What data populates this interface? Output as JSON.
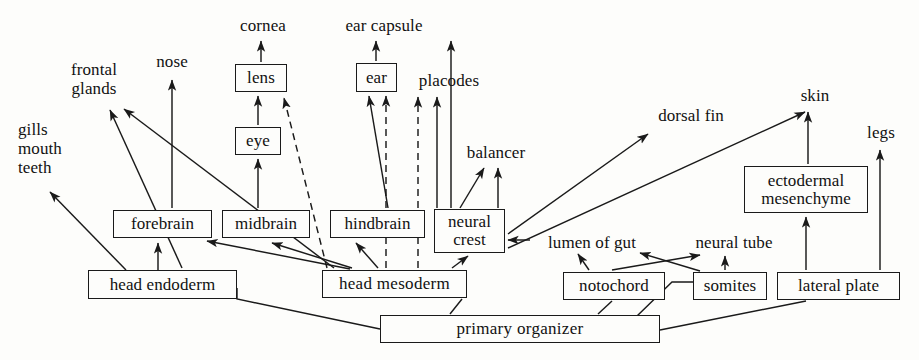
{
  "diagram": {
    "stroke_color": "#1a1a1a",
    "background_color": "#fdfdfb",
    "boxes": [
      {
        "id": "forebrain",
        "label": "forebrain",
        "x": 113,
        "y": 210,
        "w": 99,
        "h": 28
      },
      {
        "id": "midbrain",
        "label": "midbrain",
        "x": 222,
        "y": 210,
        "w": 88,
        "h": 28
      },
      {
        "id": "hindbrain",
        "label": "hindbrain",
        "x": 330,
        "y": 210,
        "w": 95,
        "h": 28
      },
      {
        "id": "neural-crest",
        "label": "neural\ncrest",
        "x": 434,
        "y": 209,
        "w": 71,
        "h": 44
      },
      {
        "id": "lens",
        "label": "lens",
        "x": 235,
        "y": 64,
        "w": 52,
        "h": 28
      },
      {
        "id": "eye",
        "label": "eye",
        "x": 235,
        "y": 127,
        "w": 46,
        "h": 28
      },
      {
        "id": "ear",
        "label": "ear",
        "x": 356,
        "y": 63,
        "w": 41,
        "h": 29
      },
      {
        "id": "head-endoderm",
        "label": "head endoderm",
        "x": 88,
        "y": 270,
        "w": 149,
        "h": 29
      },
      {
        "id": "head-mesoderm",
        "label": "head  mesoderm",
        "x": 322,
        "y": 270,
        "w": 145,
        "h": 28
      },
      {
        "id": "ectodermal-mesenchyme",
        "label": "ectodermal\nmesenchyme",
        "x": 744,
        "y": 166,
        "w": 124,
        "h": 47
      },
      {
        "id": "notochord",
        "label": "notochord",
        "x": 563,
        "y": 272,
        "w": 102,
        "h": 28
      },
      {
        "id": "somites",
        "label": "somites",
        "x": 693,
        "y": 272,
        "w": 74,
        "h": 28
      },
      {
        "id": "lateral-plate",
        "label": "lateral plate",
        "x": 777,
        "y": 272,
        "w": 123,
        "h": 28
      },
      {
        "id": "primary-organizer",
        "label": "primary            organizer",
        "x": 380,
        "y": 315,
        "w": 280,
        "h": 28
      }
    ],
    "labels": [
      {
        "id": "gills-mouth-teeth",
        "label": "gills\nmouth\nteeth",
        "x": 18,
        "y": 120,
        "w": 62,
        "align": "left"
      },
      {
        "id": "frontal-glands",
        "label": "frontal\nglands",
        "x": 58,
        "y": 60,
        "w": 72,
        "align": "center"
      },
      {
        "id": "nose",
        "label": "nose",
        "x": 148,
        "y": 52,
        "w": 48,
        "align": "center"
      },
      {
        "id": "cornea",
        "label": "cornea",
        "x": 232,
        "y": 16,
        "w": 62,
        "align": "center"
      },
      {
        "id": "ear-capsule",
        "label": "ear capsule",
        "x": 334,
        "y": 16,
        "w": 100,
        "align": "center"
      },
      {
        "id": "placodes",
        "label": "placodes",
        "x": 410,
        "y": 71,
        "w": 78,
        "align": "center"
      },
      {
        "id": "balancer",
        "label": "balancer",
        "x": 459,
        "y": 143,
        "w": 74,
        "align": "center"
      },
      {
        "id": "dorsal-fin",
        "label": "dorsal fin",
        "x": 648,
        "y": 106,
        "w": 86,
        "align": "center"
      },
      {
        "id": "skin",
        "label": "skin",
        "x": 793,
        "y": 86,
        "w": 44,
        "align": "center"
      },
      {
        "id": "legs",
        "label": "legs",
        "x": 860,
        "y": 123,
        "w": 42,
        "align": "center"
      },
      {
        "id": "lumen-of-gut",
        "label": "lumen of gut",
        "x": 533,
        "y": 233,
        "w": 118,
        "align": "center"
      },
      {
        "id": "neural-tube",
        "label": "neural tube",
        "x": 683,
        "y": 233,
        "w": 102,
        "align": "center"
      }
    ],
    "edges": [
      {
        "id": "head-endoderm-to-gills",
        "from": "head endoderm",
        "to": "gills mouth teeth",
        "style": "solid"
      },
      {
        "id": "head-endoderm-to-forebrain",
        "from": "head endoderm",
        "to": "forebrain",
        "style": "solid"
      },
      {
        "id": "head-endoderm-to-frontal-glands",
        "from": "head endoderm",
        "to": "frontal glands",
        "style": "solid"
      },
      {
        "id": "head-mesoderm-to-frontal-glands",
        "from": "head mesoderm",
        "to": "frontal glands",
        "style": "solid"
      },
      {
        "id": "head-mesoderm-to-forebrain",
        "from": "head mesoderm",
        "to": "forebrain",
        "style": "solid"
      },
      {
        "id": "head-mesoderm-to-midbrain",
        "from": "head mesoderm",
        "to": "midbrain",
        "style": "solid"
      },
      {
        "id": "head-mesoderm-to-hindbrain",
        "from": "head mesoderm",
        "to": "hindbrain",
        "style": "solid"
      },
      {
        "id": "head-mesoderm-to-lens",
        "from": "head mesoderm",
        "to": "lens",
        "style": "dashed"
      },
      {
        "id": "head-mesoderm-to-ear-a",
        "from": "head mesoderm",
        "to": "ear",
        "style": "dashed"
      },
      {
        "id": "head-mesoderm-to-placodes",
        "from": "head mesoderm",
        "to": "placodes",
        "style": "dashed"
      },
      {
        "id": "head-mesoderm-to-neural-crest",
        "from": "head mesoderm",
        "to": "neural crest",
        "style": "solid"
      },
      {
        "id": "forebrain-to-nose",
        "from": "forebrain",
        "to": "nose",
        "style": "solid"
      },
      {
        "id": "midbrain-to-eye",
        "from": "midbrain",
        "to": "eye",
        "style": "solid"
      },
      {
        "id": "eye-to-lens",
        "from": "eye",
        "to": "lens",
        "style": "solid"
      },
      {
        "id": "lens-to-cornea",
        "from": "lens",
        "to": "cornea",
        "style": "solid"
      },
      {
        "id": "hindbrain-to-ear",
        "from": "hindbrain",
        "to": "ear",
        "style": "solid"
      },
      {
        "id": "hindbrain-to-placodes",
        "from": "hindbrain",
        "to": "placodes",
        "style": "solid"
      },
      {
        "id": "ear-to-ear-capsule",
        "from": "ear",
        "to": "ear capsule",
        "style": "solid"
      },
      {
        "id": "neural-crest-to-balancer-a",
        "from": "neural crest",
        "to": "balancer",
        "style": "solid"
      },
      {
        "id": "neural-crest-to-balancer-b",
        "from": "neural crest",
        "to": "balancer",
        "style": "solid"
      },
      {
        "id": "neural-crest-to-ear-capsule",
        "from": "neural crest",
        "to": "ear capsule",
        "style": "solid"
      },
      {
        "id": "neural-crest-to-dorsal-fin",
        "from": "neural crest",
        "to": "dorsal fin",
        "style": "solid"
      },
      {
        "id": "neural-crest-to-skin",
        "from": "neural crest",
        "to": "skin",
        "style": "solid"
      },
      {
        "id": "lumen-of-gut-to-neural-crest",
        "from": "lumen of gut",
        "to": "neural crest",
        "style": "solid"
      },
      {
        "id": "notochord-to-lumen-of-gut",
        "from": "notochord",
        "to": "lumen of gut",
        "style": "solid"
      },
      {
        "id": "notochord-to-neural-tube",
        "from": "notochord",
        "to": "neural tube",
        "style": "solid"
      },
      {
        "id": "somites-to-neural-tube",
        "from": "somites",
        "to": "neural tube",
        "style": "solid"
      },
      {
        "id": "somites-to-neural-tube-b",
        "from": "somites",
        "to": "neural tube",
        "style": "solid"
      },
      {
        "id": "lateral-plate-to-ectodermal-mesenchyme",
        "from": "lateral plate",
        "to": "ectodermal mesenchyme",
        "style": "solid"
      },
      {
        "id": "lateral-plate-to-legs",
        "from": "lateral plate",
        "to": "legs",
        "style": "solid"
      },
      {
        "id": "ectodermal-mesenchyme-to-skin",
        "from": "ectodermal mesenchyme",
        "to": "skin",
        "style": "solid"
      },
      {
        "id": "primary-organizer-to-head-endoderm",
        "from": "primary organizer",
        "to": "head endoderm",
        "style": "solid"
      },
      {
        "id": "primary-organizer-to-head-mesoderm",
        "from": "primary organizer",
        "to": "head mesoderm",
        "style": "solid"
      },
      {
        "id": "primary-organizer-to-notochord",
        "from": "primary organizer",
        "to": "notochord",
        "style": "solid"
      },
      {
        "id": "primary-organizer-to-somites",
        "from": "primary organizer",
        "to": "somites",
        "style": "solid"
      },
      {
        "id": "primary-organizer-to-lateral-plate",
        "from": "primary organizer",
        "to": "lateral plate",
        "style": "solid"
      }
    ]
  }
}
